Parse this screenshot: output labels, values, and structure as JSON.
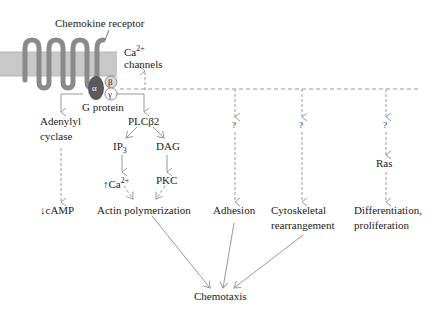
{
  "diagram": {
    "receptor_label": "Chemokine receptor",
    "ca_channels": {
      "base": "Ca",
      "sup": "2+",
      "line2": "channels"
    },
    "g_protein": {
      "label": "G protein",
      "alpha": "α",
      "beta": "β",
      "gamma": "γ"
    },
    "adenylyl_cyclase": {
      "line1": "Adenylyl",
      "line2": "cyclase"
    },
    "plcb2": "PLCβ2",
    "ip3": {
      "base": "IP",
      "sub": "3"
    },
    "dag": "DAG",
    "ca_up": {
      "arrow": "↑",
      "base": "Ca",
      "sup": "2+"
    },
    "pkc": "PKC",
    "camp_down": "↓cAMP",
    "actin": "Actin polymerization",
    "adhesion": "Adhesion",
    "cytoskeletal": {
      "line1": "Cytoskeletal",
      "line2": "rearrangement"
    },
    "differentiation": {
      "line1": "Differentiation,",
      "line2": "proliferation"
    },
    "ras": "Ras",
    "unknown": "?",
    "chemotaxis": "Chemotaxis",
    "colors": {
      "membrane": "#c8c8c8",
      "receptor": "#8a8a8a",
      "alpha": "#5a5a5a",
      "arrow": "#999999"
    }
  }
}
